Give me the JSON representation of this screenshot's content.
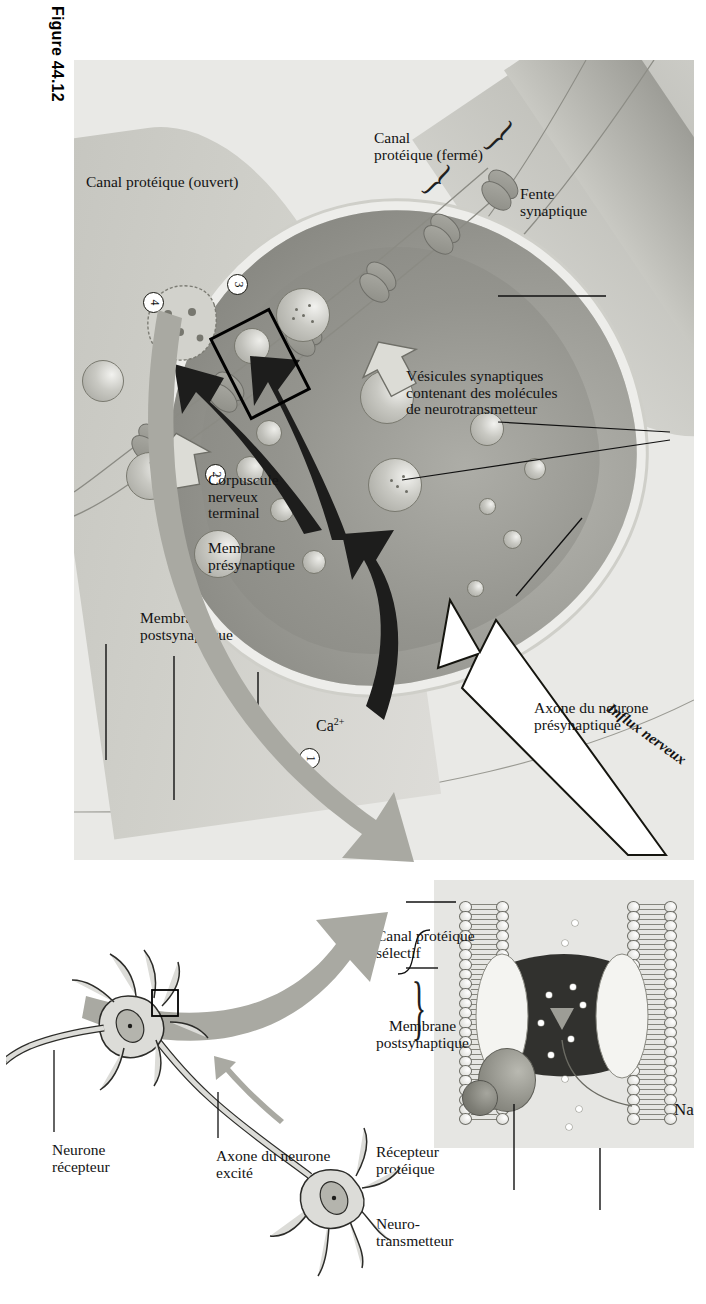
{
  "figure": {
    "label": "Figure 44.12",
    "language": "fr"
  },
  "main_diagram": {
    "labels": {
      "influx": "Influx nerveux",
      "presynaptic_axon": "Axone du neurone\nprésynaptique",
      "vesicles": "Vésicules synaptiques\ncontenant des molécules\nde neurotransmetteur",
      "synaptic_cleft": "Fente\nsynaptique",
      "closed_channel": "Canal\nprotéique (fermé)",
      "open_channel": "Canal protéique (ouvert)",
      "terminal": "Corpuscule\nnerveux\nterminal",
      "presynaptic_membrane": "Membrane\nprésynaptique",
      "postsynaptic_membrane": "Membrane\npostsynaptique",
      "calcium": "Ca",
      "calcium_charge": "2+"
    },
    "steps": [
      "1",
      "2",
      "3",
      "4"
    ]
  },
  "inset_detail": {
    "labels": {
      "sodium": "Na",
      "sodium_charge": "+",
      "neurotransmitter": "Neuro-\ntransmetteur",
      "protein_receptor": "Récepteur\nprotéique",
      "postsynaptic_membrane": "Membrane\npostsynaptique",
      "selective_channel": "Canal protéique\nsélectif"
    }
  },
  "neuron_schematic": {
    "labels": {
      "excited_axon": "Axone du neurone\nexcité",
      "receiving_neuron": "Neurone\nrécepteur"
    }
  },
  "colors": {
    "panel_background": "#e9e9e6",
    "page_background": "#ffffff",
    "terminal_fill": "#9c9c96",
    "membrane_grey": "#cfcfc9",
    "arrow_black": "#1d1d1c",
    "arrow_grey": "#a9a9a2",
    "text": "#131313"
  }
}
